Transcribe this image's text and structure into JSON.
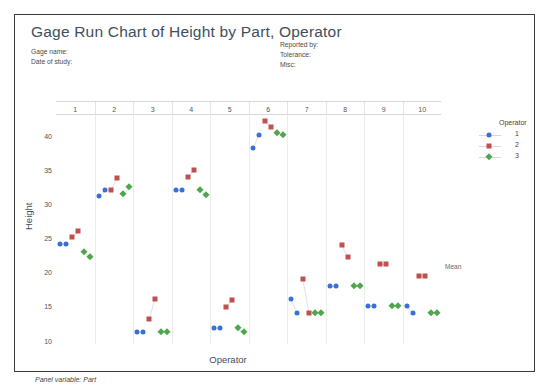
{
  "chart": {
    "title": "Gage Run Chart of Height by Part, Operator",
    "header_left": [
      "Gage name:",
      "Date of study:"
    ],
    "header_right": [
      "Reported by:",
      "Tolerance:",
      "Misc:"
    ],
    "footer_note": "Panel variable: Part",
    "mean_label": "Mean",
    "legend": {
      "title": "Operator",
      "entries": [
        {
          "label": "1",
          "symbol": "circle",
          "color": "#3a6fd8"
        },
        {
          "label": "2",
          "symbol": "square",
          "color": "#c0504d"
        },
        {
          "label": "3",
          "symbol": "diamond",
          "color": "#4ea64e"
        }
      ]
    }
  },
  "chart_data": {
    "type": "scatter",
    "title": "Gage Run Chart of Height by Part, Operator",
    "xlabel": "Operator",
    "ylabel": "Height",
    "panel_variable": "Part",
    "panels": [
      "1",
      "2",
      "3",
      "4",
      "5",
      "6",
      "7",
      "8",
      "9",
      "10"
    ],
    "ylim": [
      9.5,
      43
    ],
    "yticks": [
      10,
      15,
      20,
      25,
      30,
      35,
      40
    ],
    "grid": false,
    "legend_position": "right",
    "mean_reference": 20.8,
    "series": [
      {
        "name": "1",
        "symbol": "circle",
        "color": "#3a6fd8"
      },
      {
        "name": "2",
        "symbol": "square",
        "color": "#c0504d"
      },
      {
        "name": "3",
        "symbol": "diamond",
        "color": "#4ea64e"
      }
    ],
    "measurements": [
      {
        "part": "1",
        "operator": "1",
        "values": [
          24.1,
          24.1
        ]
      },
      {
        "part": "1",
        "operator": "2",
        "values": [
          25.2,
          26.1
        ]
      },
      {
        "part": "1",
        "operator": "3",
        "values": [
          23.0,
          22.3
        ]
      },
      {
        "part": "2",
        "operator": "1",
        "values": [
          31.2,
          32.0
        ]
      },
      {
        "part": "2",
        "operator": "2",
        "values": [
          32.0,
          33.8
        ]
      },
      {
        "part": "2",
        "operator": "3",
        "values": [
          31.5,
          32.4
        ]
      },
      {
        "part": "3",
        "operator": "1",
        "values": [
          11.2,
          11.2
        ]
      },
      {
        "part": "3",
        "operator": "2",
        "values": [
          13.1,
          16.1
        ]
      },
      {
        "part": "3",
        "operator": "3",
        "values": [
          11.2,
          11.2
        ]
      },
      {
        "part": "4",
        "operator": "1",
        "values": [
          32.0,
          32.0
        ]
      },
      {
        "part": "4",
        "operator": "2",
        "values": [
          33.9,
          35.0
        ]
      },
      {
        "part": "4",
        "operator": "3",
        "values": [
          32.0,
          31.3
        ]
      },
      {
        "part": "5",
        "operator": "1",
        "values": [
          11.9,
          11.9
        ]
      },
      {
        "part": "5",
        "operator": "2",
        "values": [
          14.9,
          16.0
        ]
      },
      {
        "part": "5",
        "operator": "3",
        "values": [
          11.9,
          11.2
        ]
      },
      {
        "part": "6",
        "operator": "1",
        "values": [
          38.1,
          40.1
        ]
      },
      {
        "part": "6",
        "operator": "2",
        "values": [
          42.1,
          41.2
        ]
      },
      {
        "part": "6",
        "operator": "3",
        "values": [
          40.4,
          40.1
        ]
      },
      {
        "part": "7",
        "operator": "1",
        "values": [
          16.1,
          14.0
        ]
      },
      {
        "part": "7",
        "operator": "2",
        "values": [
          19.0,
          14.0
        ]
      },
      {
        "part": "7",
        "operator": "3",
        "values": [
          14.0,
          14.0
        ]
      },
      {
        "part": "8",
        "operator": "1",
        "values": [
          18.0,
          18.0
        ]
      },
      {
        "part": "8",
        "operator": "2",
        "values": [
          24.0,
          22.2
        ]
      },
      {
        "part": "8",
        "operator": "3",
        "values": [
          18.0,
          18.0
        ]
      },
      {
        "part": "9",
        "operator": "1",
        "values": [
          15.1,
          15.1
        ]
      },
      {
        "part": "9",
        "operator": "2",
        "values": [
          21.2,
          21.2
        ]
      },
      {
        "part": "9",
        "operator": "3",
        "values": [
          15.1,
          15.1
        ]
      },
      {
        "part": "10",
        "operator": "1",
        "values": [
          15.1,
          14.0
        ]
      },
      {
        "part": "10",
        "operator": "2",
        "values": [
          19.5,
          19.5
        ]
      },
      {
        "part": "10",
        "operator": "3",
        "values": [
          14.0,
          14.0
        ]
      }
    ]
  }
}
